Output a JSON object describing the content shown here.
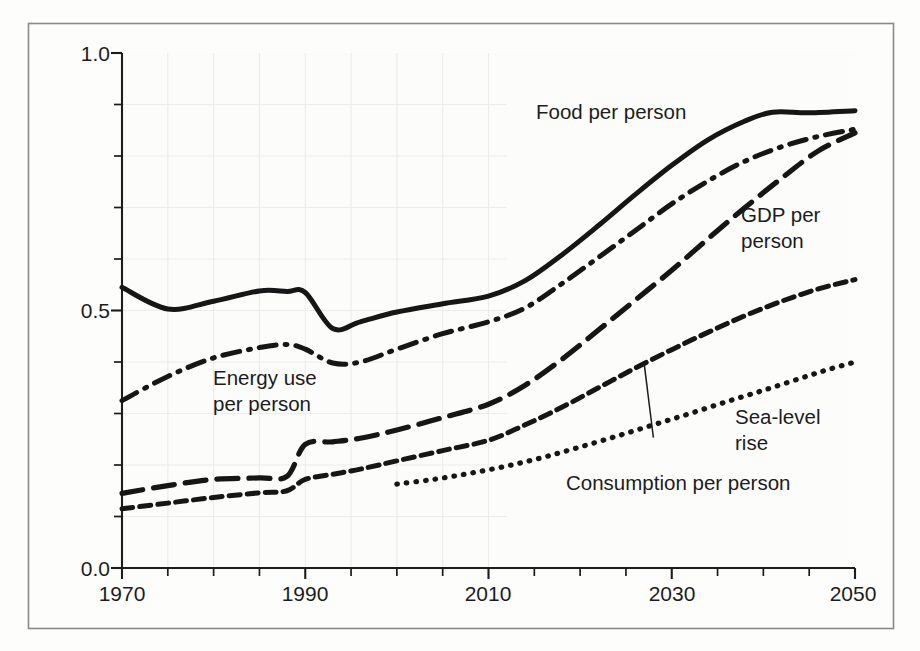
{
  "chart_data": {
    "type": "line",
    "title": "",
    "xlabel": "",
    "ylabel": "",
    "xlim": [
      1970,
      2050
    ],
    "ylim": [
      0.0,
      1.0
    ],
    "grid": true,
    "grid_note": "faint grid visible over historical region only (1970-2010)",
    "legend_position": "inline-annotations",
    "y_ticks_major": [
      "0.0",
      "0.5",
      "1.0"
    ],
    "y_tick_values_major": [
      0.0,
      0.5,
      1.0
    ],
    "y_tick_values_minor": [
      0.1,
      0.2,
      0.3,
      0.4,
      0.6,
      0.7,
      0.8,
      0.9
    ],
    "x_ticks_major": [
      "1970",
      "1990",
      "2010",
      "2030",
      "2050"
    ],
    "x_tick_values_major": [
      1970,
      1990,
      2010,
      2030,
      2050
    ],
    "x_tick_values_minor": [
      1975,
      1980,
      1985,
      1995,
      2000,
      2005,
      2015,
      2020,
      2025,
      2035,
      2040,
      2045
    ],
    "series": [
      {
        "name": "Food per person",
        "label": "Food per person",
        "style": "solid",
        "x": [
          1970,
          1975,
          1980,
          1985,
          1988,
          1990,
          1993,
          1996,
          2000,
          2005,
          2010,
          2014,
          2018,
          2022,
          2026,
          2030,
          2034,
          2038,
          2041,
          2045,
          2050
        ],
        "y": [
          0.545,
          0.503,
          0.518,
          0.538,
          0.537,
          0.535,
          0.465,
          0.478,
          0.497,
          0.513,
          0.528,
          0.558,
          0.608,
          0.665,
          0.725,
          0.782,
          0.832,
          0.868,
          0.885,
          0.884,
          0.888
        ]
      },
      {
        "name": "Energy use per person",
        "label": "Energy use per person",
        "label_line1": "Energy use",
        "label_line2": "per person",
        "style": "dash-dot",
        "x": [
          1970,
          1975,
          1980,
          1985,
          1988,
          1990,
          1993,
          1996,
          2000,
          2005,
          2010,
          2014,
          2018,
          2022,
          2026,
          2030,
          2034,
          2038,
          2042,
          2046,
          2050
        ],
        "y": [
          0.325,
          0.372,
          0.408,
          0.428,
          0.434,
          0.425,
          0.398,
          0.4,
          0.425,
          0.455,
          0.478,
          0.505,
          0.552,
          0.603,
          0.655,
          0.707,
          0.752,
          0.79,
          0.818,
          0.838,
          0.852
        ]
      },
      {
        "name": "GDP per person",
        "label": "GDP per person",
        "label_line1": "GDP per",
        "label_line2": "person",
        "style": "long-dash",
        "x": [
          1970,
          1975,
          1980,
          1985,
          1988,
          1990,
          1993,
          1996,
          2000,
          2005,
          2010,
          2014,
          2018,
          2022,
          2026,
          2030,
          2034,
          2038,
          2042,
          2046,
          2050
        ],
        "y": [
          0.145,
          0.16,
          0.172,
          0.175,
          0.178,
          0.24,
          0.245,
          0.252,
          0.268,
          0.292,
          0.318,
          0.355,
          0.405,
          0.462,
          0.52,
          0.578,
          0.64,
          0.7,
          0.757,
          0.81,
          0.845
        ]
      },
      {
        "name": "Consumption per person",
        "label": "Consumption per person",
        "style": "medium-dash",
        "x": [
          1970,
          1975,
          1980,
          1985,
          1988,
          1990,
          1993,
          1996,
          2000,
          2005,
          2010,
          2014,
          2018,
          2022,
          2026,
          2030,
          2034,
          2038,
          2042,
          2046,
          2050
        ],
        "y": [
          0.115,
          0.126,
          0.137,
          0.146,
          0.15,
          0.172,
          0.182,
          0.192,
          0.208,
          0.228,
          0.248,
          0.278,
          0.312,
          0.35,
          0.388,
          0.424,
          0.458,
          0.49,
          0.518,
          0.542,
          0.56
        ]
      },
      {
        "name": "Sea-level rise",
        "label": "Sea-level rise",
        "label_line1": "Sea-level",
        "label_line2": "rise",
        "style": "dotted",
        "x": [
          2000,
          2004,
          2008,
          2012,
          2016,
          2020,
          2024,
          2028,
          2032,
          2036,
          2040,
          2044,
          2047,
          2050
        ],
        "y": [
          0.163,
          0.172,
          0.184,
          0.198,
          0.215,
          0.235,
          0.256,
          0.278,
          0.3,
          0.323,
          0.345,
          0.368,
          0.385,
          0.4
        ]
      }
    ],
    "annotations": [
      {
        "name": "consumption-leader-line",
        "text": "Consumption per person",
        "from_year": 2028,
        "from_value": 0.253,
        "to_year": 2027,
        "to_value": 0.395
      }
    ]
  },
  "labels": {
    "food": "Food per person",
    "energy_line1": "Energy use",
    "energy_line2": "per person",
    "gdp_line1": "GDP per",
    "gdp_line2": "person",
    "sealevel_line1": "Sea-level",
    "sealevel_line2": "rise",
    "consumption": "Consumption per person"
  },
  "axis": {
    "y0": "0.0",
    "y1": "0.5",
    "y2": "1.0",
    "x0": "1970",
    "x1": "1990",
    "x2": "2010",
    "x3": "2030",
    "x4": "2050"
  },
  "colors": {
    "line": "#161616",
    "grid": "#ececea",
    "frame": "#8a8a8a",
    "background": "#fdfdfc",
    "text": "#1c1c1c"
  }
}
